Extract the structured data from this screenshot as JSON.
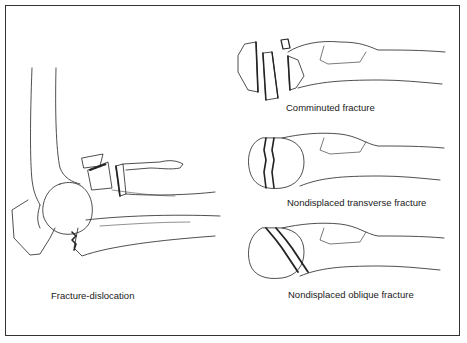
{
  "figure": {
    "panels": [
      {
        "id": "fracture-dislocation",
        "label": "Fracture-dislocation"
      },
      {
        "id": "comminuted",
        "label": "Comminuted fracture"
      },
      {
        "id": "nondisplaced-transverse",
        "label": "Nondisplaced transverse fracture"
      },
      {
        "id": "nondisplaced-oblique",
        "label": "Nondisplaced oblique fracture"
      }
    ],
    "colors": {
      "line": "#222222",
      "border": "#333333",
      "background": "#ffffff"
    }
  }
}
